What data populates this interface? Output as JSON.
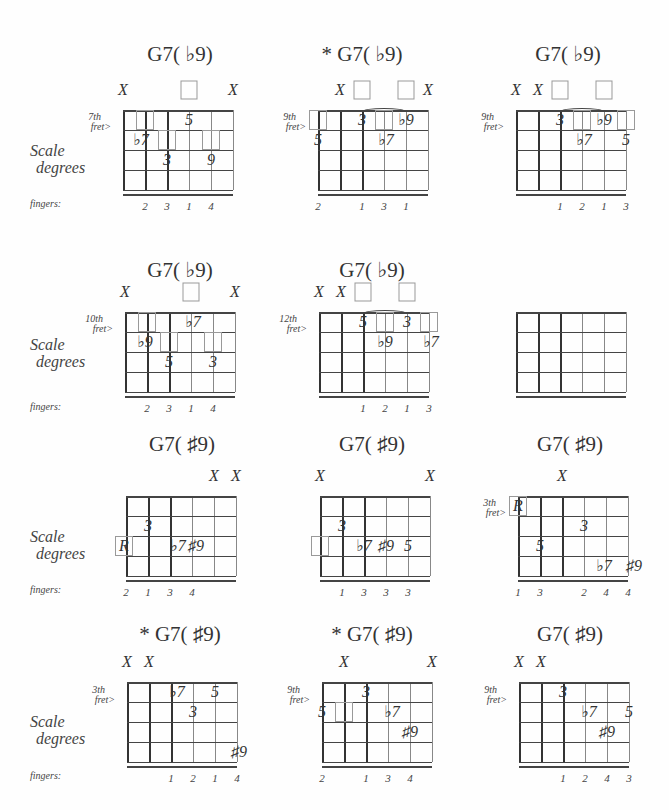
{
  "labels": {
    "scale_degrees_line1": "Scale",
    "scale_degrees_line2": "degrees",
    "fingers": "fingers:"
  },
  "side_labels": [
    {
      "x": 30,
      "y": 142,
      "line1": "Scale",
      "line2": "degrees"
    },
    {
      "x": 30,
      "y": 336,
      "line1": "Scale",
      "line2": "degrees"
    },
    {
      "x": 30,
      "y": 528,
      "line1": "Scale",
      "line2": "degrees"
    },
    {
      "x": 30,
      "y": 713,
      "line1": "Scale",
      "line2": "degrees"
    }
  ],
  "fingers_labels": [
    {
      "x": 30,
      "y": 198
    },
    {
      "x": 30,
      "y": 401
    },
    {
      "x": 30,
      "y": 584
    },
    {
      "x": 30,
      "y": 770
    }
  ],
  "diagrams": [
    {
      "title": "G7( ♭9)",
      "cx": 180,
      "ty": 42,
      "gx": 123,
      "gy": 110,
      "fret_label": "7th\nfret>",
      "fret_label_y": 112,
      "top": [
        {
          "s": 0,
          "t": "X"
        },
        {
          "s": 3,
          "t": "box"
        },
        {
          "s": 5,
          "t": "X"
        }
      ],
      "boxes": [
        {
          "s": 1,
          "r": 0
        },
        {
          "s": 2,
          "r": 1
        },
        {
          "s": 4,
          "r": 1
        }
      ],
      "marks": [
        {
          "s": 3,
          "r": 0,
          "t": "5"
        },
        {
          "s": 1,
          "r": 1,
          "t": "♭7",
          "dx": -4
        },
        {
          "s": 2,
          "r": 2,
          "t": "3"
        },
        {
          "s": 4,
          "r": 2,
          "t": "9"
        }
      ],
      "fingers": [
        {
          "s": 1,
          "t": "2"
        },
        {
          "s": 2,
          "t": "3"
        },
        {
          "s": 3,
          "t": "1"
        },
        {
          "s": 4,
          "t": "4"
        }
      ],
      "arc": null
    },
    {
      "title": "* G7( ♭9)",
      "cx": 362,
      "ty": 42,
      "gx": 318,
      "gy": 110,
      "fret_label": "9th\nfret>",
      "fret_label_y": 112,
      "top": [
        {
          "s": 1,
          "t": "X"
        },
        {
          "s": 2,
          "t": "box"
        },
        {
          "s": 4,
          "t": "box"
        },
        {
          "s": 5,
          "t": "X"
        }
      ],
      "boxes": [
        {
          "s": 0,
          "r": 0
        },
        {
          "s": 3,
          "r": 0
        }
      ],
      "marks": [
        {
          "s": 2,
          "r": 0,
          "t": "3"
        },
        {
          "s": 4,
          "r": 0,
          "t": "♭9"
        },
        {
          "s": 0,
          "r": 1,
          "t": "5"
        },
        {
          "s": 3,
          "r": 1,
          "t": "♭7",
          "dx": 2
        }
      ],
      "fingers": [
        {
          "s": 0,
          "t": "2"
        },
        {
          "s": 2,
          "t": "1"
        },
        {
          "s": 3,
          "t": "3"
        },
        {
          "s": 4,
          "t": "1"
        }
      ],
      "arc": {
        "s1": 2,
        "s2": 4
      }
    },
    {
      "title": "G7( ♭9)",
      "cx": 568,
      "ty": 42,
      "gx": 516,
      "gy": 110,
      "fret_label": "9th\nfret>",
      "fret_label_y": 112,
      "top": [
        {
          "s": 0,
          "t": "X"
        },
        {
          "s": 1,
          "t": "X"
        },
        {
          "s": 2,
          "t": "box"
        },
        {
          "s": 4,
          "t": "box"
        }
      ],
      "boxes": [
        {
          "s": 3,
          "r": 0
        },
        {
          "s": 5,
          "r": 0
        }
      ],
      "marks": [
        {
          "s": 2,
          "r": 0,
          "t": "3"
        },
        {
          "s": 4,
          "r": 0,
          "t": "♭9"
        },
        {
          "s": 3,
          "r": 1,
          "t": "♭7",
          "dx": 2
        },
        {
          "s": 5,
          "r": 1,
          "t": "5"
        }
      ],
      "fingers": [
        {
          "s": 2,
          "t": "1"
        },
        {
          "s": 3,
          "t": "2"
        },
        {
          "s": 4,
          "t": "1"
        },
        {
          "s": 5,
          "t": "3"
        }
      ],
      "arc": {
        "s1": 2,
        "s2": 4
      }
    },
    {
      "title": "G7( ♭9)",
      "cx": 180,
      "ty": 258,
      "gx": 125,
      "gy": 312,
      "fret_label": "10th\nfret>",
      "fret_label_y": 314,
      "top": [
        {
          "s": 0,
          "t": "X"
        },
        {
          "s": 3,
          "t": "box"
        },
        {
          "s": 5,
          "t": "X"
        }
      ],
      "boxes": [
        {
          "s": 1,
          "r": 0
        },
        {
          "s": 2,
          "r": 1
        },
        {
          "s": 4,
          "r": 1
        }
      ],
      "marks": [
        {
          "s": 3,
          "r": 0,
          "t": "♭7",
          "dx": 2
        },
        {
          "s": 1,
          "r": 1,
          "t": "♭9",
          "dx": -2
        },
        {
          "s": 2,
          "r": 2,
          "t": "5"
        },
        {
          "s": 4,
          "r": 2,
          "t": "3"
        }
      ],
      "fingers": [
        {
          "s": 1,
          "t": "2"
        },
        {
          "s": 2,
          "t": "3"
        },
        {
          "s": 3,
          "t": "1"
        },
        {
          "s": 4,
          "t": "4"
        }
      ],
      "arc": null
    },
    {
      "title": "G7( ♭9)",
      "cx": 372,
      "ty": 258,
      "gx": 319,
      "gy": 312,
      "fret_label": "12th\nfret>",
      "fret_label_y": 314,
      "top": [
        {
          "s": 0,
          "t": "X"
        },
        {
          "s": 1,
          "t": "X"
        },
        {
          "s": 2,
          "t": "box"
        },
        {
          "s": 4,
          "t": "box"
        }
      ],
      "boxes": [
        {
          "s": 3,
          "r": 0
        },
        {
          "s": 5,
          "r": 0
        }
      ],
      "marks": [
        {
          "s": 2,
          "r": 0,
          "t": "5"
        },
        {
          "s": 4,
          "r": 0,
          "t": "3"
        },
        {
          "s": 3,
          "r": 1,
          "t": "♭9"
        },
        {
          "s": 5,
          "r": 1,
          "t": "♭7",
          "dx": 2
        }
      ],
      "fingers": [
        {
          "s": 2,
          "t": "1"
        },
        {
          "s": 3,
          "t": "2"
        },
        {
          "s": 4,
          "t": "1"
        },
        {
          "s": 5,
          "t": "3"
        }
      ],
      "arc": {
        "s1": 2,
        "s2": 4
      }
    },
    {
      "title": "",
      "cx": 570,
      "ty": 258,
      "gx": 516,
      "gy": 312,
      "fret_label": "",
      "fret_label_y": 314,
      "top": [],
      "boxes": [],
      "marks": [],
      "fingers": [],
      "arc": null
    },
    {
      "title": "G7( ♯9)",
      "cx": 182,
      "ty": 432,
      "gx": 126,
      "gy": 496,
      "fret_label": "",
      "fret_label_y": 498,
      "top": [
        {
          "s": 4,
          "t": "X"
        },
        {
          "s": 5,
          "t": "X"
        }
      ],
      "boxes": [
        {
          "s": 0,
          "r": 2,
          "dx": -2
        }
      ],
      "marks": [
        {
          "s": 1,
          "r": 1,
          "t": "3"
        },
        {
          "s": 0,
          "r": 2,
          "t": "R",
          "dx": -2
        },
        {
          "s": 2,
          "r": 2,
          "t": "♭7",
          "dx": 8
        },
        {
          "s": 3,
          "r": 2,
          "t": "♯9",
          "dx": 4
        }
      ],
      "fingers": [
        {
          "s": 0,
          "t": "2"
        },
        {
          "s": 1,
          "t": "1"
        },
        {
          "s": 2,
          "t": "3"
        },
        {
          "s": 3,
          "t": "4"
        }
      ],
      "arc": null
    },
    {
      "title": "G7( ♯9)",
      "cx": 372,
      "ty": 432,
      "gx": 320,
      "gy": 496,
      "fret_label": "",
      "fret_label_y": 498,
      "top": [
        {
          "s": 0,
          "t": "X"
        },
        {
          "s": 5,
          "t": "X"
        }
      ],
      "boxes": [
        {
          "s": 0,
          "r": 2
        }
      ],
      "marks": [
        {
          "s": 1,
          "r": 1,
          "t": "3"
        },
        {
          "s": 2,
          "r": 2,
          "t": "♭7"
        },
        {
          "s": 3,
          "r": 2,
          "t": "♯9"
        },
        {
          "s": 4,
          "r": 2,
          "t": "5"
        }
      ],
      "fingers": [
        {
          "s": 1,
          "t": "1"
        },
        {
          "s": 2,
          "t": "3"
        },
        {
          "s": 3,
          "t": "3"
        },
        {
          "s": 4,
          "t": "3"
        }
      ],
      "arc": null
    },
    {
      "title": "G7( ♯9)",
      "cx": 570,
      "ty": 432,
      "gx": 518,
      "gy": 496,
      "fret_label": "3th\nfret>",
      "fret_label_y": 498,
      "top": [
        {
          "s": 2,
          "t": "X"
        }
      ],
      "boxes": [
        {
          "s": 0,
          "r": 0
        }
      ],
      "marks": [
        {
          "s": 0,
          "r": 0,
          "t": "R"
        },
        {
          "s": 3,
          "r": 1,
          "t": "3"
        },
        {
          "s": 1,
          "r": 2,
          "t": "5"
        },
        {
          "s": 4,
          "r": 3,
          "t": "♭7",
          "dx": -2
        },
        {
          "s": 5,
          "r": 3,
          "t": "♯9",
          "dx": 6
        }
      ],
      "fingers": [
        {
          "s": 0,
          "t": "1"
        },
        {
          "s": 1,
          "t": "3"
        },
        {
          "s": 3,
          "t": "2"
        },
        {
          "s": 4,
          "t": "4"
        },
        {
          "s": 5,
          "t": "4"
        }
      ],
      "arc": null
    },
    {
      "title": "* G7( ♯9)",
      "cx": 180,
      "ty": 622,
      "gx": 127,
      "gy": 682,
      "fret_label": "3th\nfret>",
      "fret_label_y": 685,
      "top": [
        {
          "s": 0,
          "t": "X"
        },
        {
          "s": 1,
          "t": "X"
        }
      ],
      "boxes": [],
      "marks": [
        {
          "s": 2,
          "r": 0,
          "t": "♭7",
          "dx": 6
        },
        {
          "s": 4,
          "r": 0,
          "t": "5"
        },
        {
          "s": 3,
          "r": 1,
          "t": "3"
        },
        {
          "s": 5,
          "r": 3,
          "t": "♯9",
          "dx": 2
        }
      ],
      "fingers": [
        {
          "s": 2,
          "t": "1"
        },
        {
          "s": 3,
          "t": "2"
        },
        {
          "s": 4,
          "t": "1"
        },
        {
          "s": 5,
          "t": "4"
        }
      ],
      "arc": null
    },
    {
      "title": "* G7( ♯9)",
      "cx": 372,
      "ty": 622,
      "gx": 322,
      "gy": 682,
      "fret_label": "9th\nfret>",
      "fret_label_y": 685,
      "top": [
        {
          "s": 1,
          "t": "X"
        },
        {
          "s": 5,
          "t": "X"
        }
      ],
      "boxes": [
        {
          "s": 1,
          "r": 1
        }
      ],
      "marks": [
        {
          "s": 2,
          "r": 0,
          "t": "3"
        },
        {
          "s": 0,
          "r": 1,
          "t": "5"
        },
        {
          "s": 3,
          "r": 1,
          "t": "♭7",
          "dx": 4
        },
        {
          "s": 4,
          "r": 2,
          "t": "♯9"
        }
      ],
      "fingers": [
        {
          "s": 0,
          "t": "2"
        },
        {
          "s": 2,
          "t": "1"
        },
        {
          "s": 3,
          "t": "3"
        },
        {
          "s": 4,
          "t": "4"
        }
      ],
      "arc": null
    },
    {
      "title": "G7( ♯9)",
      "cx": 570,
      "ty": 622,
      "gx": 519,
      "gy": 682,
      "fret_label": "9th\nfret>",
      "fret_label_y": 685,
      "top": [
        {
          "s": 0,
          "t": "X"
        },
        {
          "s": 1,
          "t": "X"
        }
      ],
      "boxes": [],
      "marks": [
        {
          "s": 2,
          "r": 0,
          "t": "3"
        },
        {
          "s": 3,
          "r": 1,
          "t": "♭7",
          "dx": 4
        },
        {
          "s": 5,
          "r": 1,
          "t": "5"
        },
        {
          "s": 4,
          "r": 2,
          "t": "♯9"
        }
      ],
      "fingers": [
        {
          "s": 2,
          "t": "1"
        },
        {
          "s": 3,
          "t": "2"
        },
        {
          "s": 4,
          "t": "4"
        },
        {
          "s": 5,
          "t": "3"
        }
      ],
      "arc": null
    }
  ]
}
